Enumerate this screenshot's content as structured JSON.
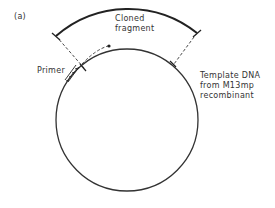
{
  "panel_label": "(a)",
  "labels": {
    "cloned_fragment_line1": "Cloned",
    "cloned_fragment_line2": "fragment",
    "primer": "Primer",
    "template_line1": "Template DNA",
    "template_line2": "from M13mp",
    "template_line3": "recombinant"
  },
  "colors": {
    "stroke": "#222222",
    "text": "#333333"
  }
}
